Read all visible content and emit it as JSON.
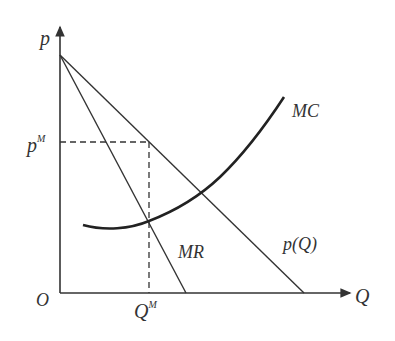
{
  "diagram": {
    "axes": {
      "y_label": "p",
      "x_label": "Q",
      "origin_label": "O"
    },
    "curves": {
      "demand_label": "p(Q)",
      "mr_label": "MR",
      "mc_label": "MC"
    },
    "markers": {
      "price_label": "p",
      "price_sup": "M",
      "quantity_label": "Q",
      "quantity_sup": "M"
    },
    "colors": {
      "line": "#333333",
      "text": "#333333",
      "background": "#ffffff"
    }
  }
}
